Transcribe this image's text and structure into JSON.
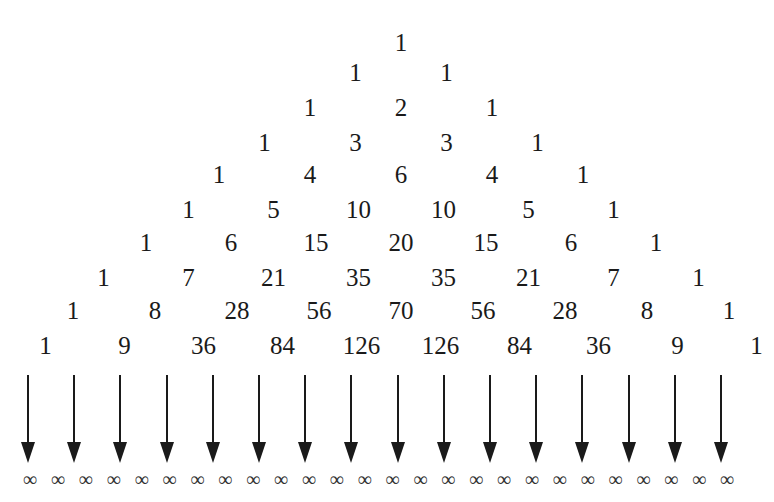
{
  "diagram": {
    "title": "",
    "type": "pascals-triangle",
    "rows": [
      [
        1
      ],
      [
        1,
        1
      ],
      [
        1,
        2,
        1
      ],
      [
        1,
        3,
        3,
        1
      ],
      [
        1,
        4,
        6,
        4,
        1
      ],
      [
        1,
        5,
        10,
        10,
        5,
        1
      ],
      [
        1,
        6,
        15,
        20,
        15,
        6,
        1
      ],
      [
        1,
        7,
        21,
        35,
        35,
        21,
        7,
        1
      ],
      [
        1,
        8,
        28,
        56,
        70,
        56,
        28,
        8,
        1
      ],
      [
        1,
        9,
        36,
        84,
        126,
        126,
        84,
        36,
        9,
        1
      ]
    ],
    "arrow_count": 16,
    "infinity_symbol": "∞",
    "infinity_count": 26
  }
}
